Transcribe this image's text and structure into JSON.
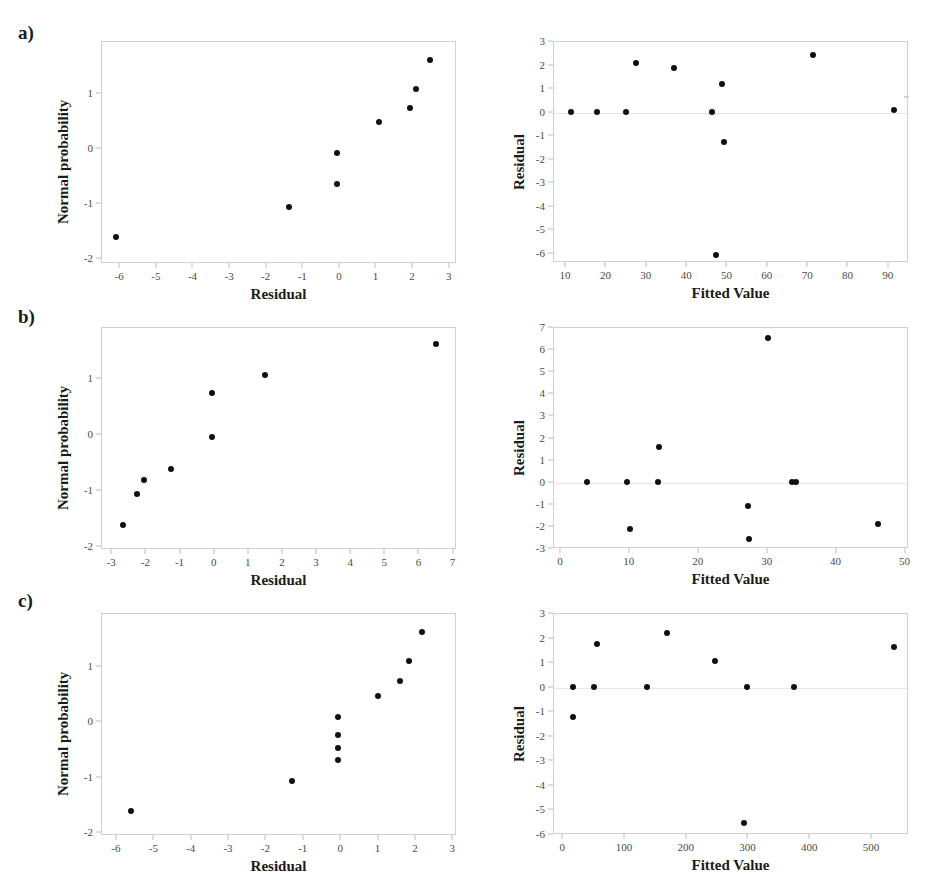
{
  "figure": {
    "panels": [
      {
        "letter": "a)"
      },
      {
        "letter": "b)"
      },
      {
        "letter": "c)"
      }
    ]
  },
  "chart_data": [
    {
      "id": "a-normal-probability",
      "panel": "a)",
      "position": "left",
      "type": "scatter",
      "title": "",
      "xlabel": "Residual",
      "ylabel": "Normal probability",
      "xlim": [
        -6.5,
        3.2
      ],
      "ylim": [
        -2.1,
        1.95
      ],
      "xticks": [
        -6,
        -5,
        -4,
        -3,
        -2,
        -1,
        0,
        1,
        2,
        3
      ],
      "xticklabels": [
        "-6",
        "-5",
        "-4",
        "-3",
        "-2",
        "-1",
        "0",
        "1",
        "2",
        "3"
      ],
      "yticks": [
        1,
        0,
        -1,
        -2
      ],
      "yticklabels": [
        "1",
        "0",
        "-1",
        "-2"
      ],
      "grid": false,
      "legend": "none",
      "points": [
        {
          "x": -6.1,
          "y": -1.62
        },
        {
          "x": -1.35,
          "y": -1.07
        },
        {
          "x": -0.05,
          "y": -0.66
        },
        {
          "x": -0.05,
          "y": -0.1
        },
        {
          "x": 1.1,
          "y": 0.47
        },
        {
          "x": 1.95,
          "y": 0.72
        },
        {
          "x": 2.1,
          "y": 1.08
        },
        {
          "x": 2.5,
          "y": 1.6
        }
      ]
    },
    {
      "id": "a-residual-vs-fitted",
      "panel": "a)",
      "position": "right",
      "type": "scatter",
      "title": "",
      "xlabel": "Fitted Value",
      "ylabel": "Residual",
      "xlim": [
        7,
        95
      ],
      "ylim": [
        -6.4,
        3.0
      ],
      "xticks": [
        10,
        20,
        30,
        40,
        50,
        60,
        70,
        80,
        90
      ],
      "xticklabels": [
        "10",
        "20",
        "30",
        "40",
        "50",
        "60",
        "70",
        "80",
        "90"
      ],
      "yticks": [
        3,
        2,
        1,
        0,
        -1,
        -2,
        -3,
        -4,
        -5,
        -6
      ],
      "yticklabels": [
        "3",
        "2",
        "1",
        "0",
        "-1",
        "-2",
        "-3",
        "-4",
        "-5",
        "-6"
      ],
      "grid": false,
      "zero_reference_line": true,
      "legend": "none",
      "points": [
        {
          "x": 11.5,
          "y": 0.0
        },
        {
          "x": 18.0,
          "y": 0.0
        },
        {
          "x": 25.0,
          "y": 0.0
        },
        {
          "x": 27.5,
          "y": 2.05
        },
        {
          "x": 37.0,
          "y": 1.85
        },
        {
          "x": 46.5,
          "y": 0.0
        },
        {
          "x": 49.0,
          "y": 1.15
        },
        {
          "x": 49.5,
          "y": -1.3
        },
        {
          "x": 47.5,
          "y": -6.1
        },
        {
          "x": 71.5,
          "y": 2.4
        },
        {
          "x": 91.5,
          "y": 0.05
        }
      ]
    },
    {
      "id": "b-normal-probability",
      "panel": "b)",
      "position": "left",
      "type": "scatter",
      "title": "",
      "xlabel": "Residual",
      "ylabel": "Normal probability",
      "xlim": [
        -3.3,
        7.1
      ],
      "ylim": [
        -2.05,
        1.9
      ],
      "xticks": [
        -3,
        -2,
        -1,
        0,
        1,
        2,
        3,
        4,
        5,
        6,
        7
      ],
      "xticklabels": [
        "-3",
        "-2",
        "-1",
        "0",
        "1",
        "2",
        "3",
        "4",
        "5",
        "6",
        "7"
      ],
      "yticks": [
        1,
        0,
        -1,
        -2
      ],
      "yticklabels": [
        "1",
        "0",
        "-1",
        "-2"
      ],
      "grid": false,
      "legend": "none",
      "points": [
        {
          "x": -2.65,
          "y": -1.62
        },
        {
          "x": -2.25,
          "y": -1.08
        },
        {
          "x": -2.05,
          "y": -0.83
        },
        {
          "x": -1.25,
          "y": -0.62
        },
        {
          "x": -0.05,
          "y": -0.05
        },
        {
          "x": -0.05,
          "y": 0.72
        },
        {
          "x": 1.5,
          "y": 1.05
        },
        {
          "x": 6.5,
          "y": 1.6
        }
      ]
    },
    {
      "id": "b-residual-vs-fitted",
      "panel": "b)",
      "position": "right",
      "type": "scatter",
      "title": "",
      "xlabel": "Fitted Value",
      "ylabel": "Residual",
      "xlim": [
        -1,
        50.5
      ],
      "ylim": [
        -3.0,
        7.0
      ],
      "xticks": [
        0,
        10,
        20,
        30,
        40,
        50
      ],
      "xticklabels": [
        "0",
        "10",
        "20",
        "30",
        "40",
        "50"
      ],
      "yticks": [
        7,
        6,
        5,
        4,
        3,
        2,
        1,
        0,
        -1,
        -2,
        -3
      ],
      "yticklabels": [
        "7",
        "6",
        "5",
        "4",
        "3",
        "2",
        "1",
        "0",
        "-1",
        "-2",
        "-3"
      ],
      "grid": false,
      "zero_reference_line": true,
      "legend": "none",
      "points": [
        {
          "x": 4.0,
          "y": 0.0
        },
        {
          "x": 9.7,
          "y": 0.0
        },
        {
          "x": 10.2,
          "y": -2.15
        },
        {
          "x": 14.3,
          "y": 0.0
        },
        {
          "x": 14.4,
          "y": 1.55
        },
        {
          "x": 27.3,
          "y": -1.1
        },
        {
          "x": 27.5,
          "y": -2.6
        },
        {
          "x": 30.2,
          "y": 6.5
        },
        {
          "x": 33.7,
          "y": 0.0
        },
        {
          "x": 34.3,
          "y": 0.0
        },
        {
          "x": 46.2,
          "y": -1.9
        }
      ]
    },
    {
      "id": "c-normal-probability",
      "panel": "c)",
      "position": "left",
      "type": "scatter",
      "title": "",
      "xlabel": "Residual",
      "ylabel": "Normal probability",
      "xlim": [
        -6.4,
        3.1
      ],
      "ylim": [
        -2.05,
        1.95
      ],
      "xticks": [
        -6,
        -5,
        -4,
        -3,
        -2,
        -1,
        0,
        1,
        2,
        3
      ],
      "xticklabels": [
        "-6",
        "-5",
        "-4",
        "-3",
        "-2",
        "-1",
        "0",
        "1",
        "2",
        "3"
      ],
      "yticks": [
        1,
        0,
        -1,
        -2
      ],
      "yticklabels": [
        "1",
        "0",
        "-1",
        "-2"
      ],
      "grid": false,
      "legend": "none",
      "points": [
        {
          "x": -5.6,
          "y": -1.62
        },
        {
          "x": -1.3,
          "y": -1.07
        },
        {
          "x": -0.05,
          "y": -0.7
        },
        {
          "x": -0.05,
          "y": -0.48
        },
        {
          "x": -0.05,
          "y": -0.25
        },
        {
          "x": -0.05,
          "y": 0.07
        },
        {
          "x": 1.0,
          "y": 0.46
        },
        {
          "x": 1.6,
          "y": 0.73
        },
        {
          "x": 1.85,
          "y": 1.08
        },
        {
          "x": 2.2,
          "y": 1.6
        }
      ]
    },
    {
      "id": "c-residual-vs-fitted",
      "panel": "c)",
      "position": "right",
      "type": "scatter",
      "title": "",
      "xlabel": "Fitted Value",
      "ylabel": "Residual",
      "xlim": [
        -15,
        560
      ],
      "ylim": [
        -6.0,
        3.0
      ],
      "xticks": [
        0,
        100,
        200,
        300,
        400,
        500
      ],
      "xticklabels": [
        "0",
        "100",
        "200",
        "300",
        "400",
        "500"
      ],
      "yticks": [
        3,
        2,
        1,
        0,
        -1,
        -2,
        -3,
        -4,
        -5,
        -6
      ],
      "yticklabels": [
        "3",
        "2",
        "1",
        "0",
        "-1",
        "-2",
        "-3",
        "-4",
        "-5",
        "-6"
      ],
      "grid": false,
      "zero_reference_line": true,
      "legend": "none",
      "points": [
        {
          "x": 18,
          "y": 0.0
        },
        {
          "x": 18,
          "y": -1.22
        },
        {
          "x": 52,
          "y": 0.0
        },
        {
          "x": 57,
          "y": 1.75
        },
        {
          "x": 138,
          "y": 0.0
        },
        {
          "x": 170,
          "y": 2.2
        },
        {
          "x": 247,
          "y": 1.05
        },
        {
          "x": 295,
          "y": -5.55
        },
        {
          "x": 300,
          "y": 0.0
        },
        {
          "x": 375,
          "y": 0.0
        },
        {
          "x": 537,
          "y": 1.6
        }
      ]
    }
  ]
}
